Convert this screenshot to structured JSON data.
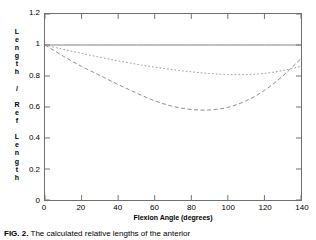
{
  "figure": {
    "caption_label": "FIG. 2.",
    "caption_text": " The calculated relative lengths of the anterior"
  },
  "chart_data": {
    "type": "line",
    "title": "",
    "xlabel": "Flexion Angle (degrees)",
    "ylabel": "Length / Ref Length",
    "ylabel_chars": [
      "L",
      "e",
      "n",
      "g",
      "t",
      "h",
      " ",
      "/",
      " ",
      "R",
      "e",
      "f",
      " ",
      "L",
      "e",
      "n",
      "g",
      "t",
      "h"
    ],
    "xlim": [
      0,
      140
    ],
    "ylim": [
      0,
      1.2
    ],
    "xticks": [
      0,
      20,
      40,
      60,
      80,
      100,
      120,
      140
    ],
    "xtick_labels": [
      "0",
      "20",
      "40",
      "60",
      "80",
      "100",
      "120",
      "140"
    ],
    "yticks": [
      0,
      0.2,
      0.4,
      0.6,
      0.8,
      1,
      1.2
    ],
    "ytick_labels": [
      "0",
      "0.2",
      "0.4",
      "0.6",
      "0.8",
      "1",
      "1.2"
    ],
    "grid": false,
    "legend": null,
    "x": [
      0,
      10,
      20,
      30,
      40,
      50,
      60,
      70,
      80,
      90,
      100,
      110,
      120,
      130,
      140
    ],
    "series": [
      {
        "name": "reference",
        "style": "solid",
        "color": "#808080",
        "values": [
          1.0,
          1.0,
          1.0,
          1.0,
          1.0,
          1.0,
          1.0,
          1.0,
          1.0,
          1.0,
          1.0,
          1.0,
          1.0,
          1.0,
          1.0
        ]
      },
      {
        "name": "dotted-curve",
        "style": "dotted",
        "color": "#9a9a9a",
        "values": [
          1.0,
          0.972,
          0.946,
          0.921,
          0.898,
          0.876,
          0.857,
          0.841,
          0.827,
          0.816,
          0.81,
          0.809,
          0.817,
          0.835,
          0.862
        ]
      },
      {
        "name": "dashed-curve",
        "style": "dashed",
        "color": "#8c8c8c",
        "values": [
          1.0,
          0.928,
          0.862,
          0.804,
          0.745,
          0.69,
          0.64,
          0.604,
          0.584,
          0.581,
          0.598,
          0.64,
          0.707,
          0.8,
          0.912
        ]
      }
    ]
  }
}
